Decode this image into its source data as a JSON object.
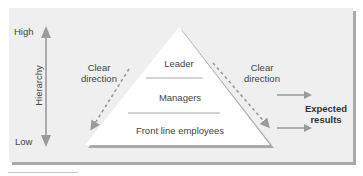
{
  "axis": {
    "high_label": "High",
    "low_label": "Low",
    "title": "Hierarchy"
  },
  "pyramid": {
    "levels": [
      {
        "label": "Leader"
      },
      {
        "label": "Managers"
      },
      {
        "label": "Front line employees"
      }
    ]
  },
  "arrows": {
    "left_label_line1": "Clear",
    "left_label_line2": "direction",
    "right_label_line1": "Clear",
    "right_label_line2": "direction"
  },
  "outcome": {
    "line1": "Expected",
    "line2": "results"
  },
  "colors": {
    "panel_bg": "#efefef",
    "pyramid_fill": "#ffffff",
    "arrow_grey": "#9a9a9a",
    "shadow": "#a9a9a9"
  }
}
